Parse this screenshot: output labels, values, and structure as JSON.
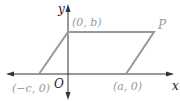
{
  "diagram": {
    "type": "parallelogram on coordinate axes",
    "axes": {
      "x_label": "x",
      "y_label": "y",
      "origin_label": "O"
    },
    "vertices": [
      {
        "label": "(−c, 0)"
      },
      {
        "label": "(0, b)"
      },
      {
        "label": "P"
      },
      {
        "label": "(a, 0)"
      }
    ],
    "colors": {
      "shape": "#999999",
      "axes": "#333333"
    }
  }
}
